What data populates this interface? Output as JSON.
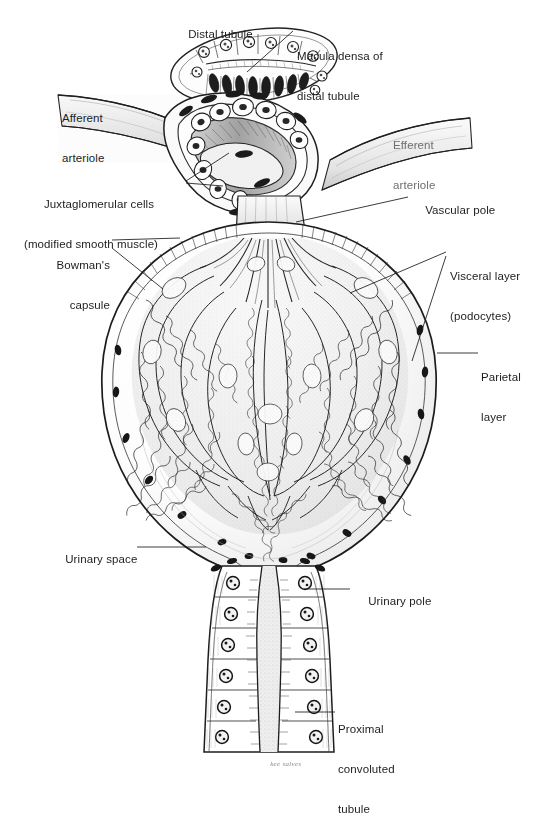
{
  "figure": {
    "medium": "pen-and-ink anatomical illustration",
    "background_color": "#ffffff",
    "ink_color": "#1a1a1a"
  },
  "labels": {
    "distal_tubule": "Distal tubule",
    "macula_densa_l1": "Macula densa of",
    "macula_densa_l2": "distal tubule",
    "afferent_l1": "Afferent",
    "afferent_l2": "arteriole",
    "efferent_l1": "Efferent",
    "efferent_l2": "arteriole",
    "jg_l1": "Juxtaglomerular cells",
    "jg_l2": "(modified smooth muscle)",
    "vascular_pole": "Vascular pole",
    "bowmans_l1": "Bowman's",
    "bowmans_l2": "capsule",
    "visceral_l1": "Visceral layer",
    "visceral_l2": "(podocytes)",
    "parietal_l1": "Parietal",
    "parietal_l2": "layer",
    "urinary_space": "Urinary space",
    "urinary_pole": "Urinary pole",
    "proximal_l1": "Proximal",
    "proximal_l2": "convoluted",
    "proximal_l3": "tubule",
    "signature": "kee salves"
  },
  "structures": [
    {
      "name": "distal-tubule-cross-section",
      "description": "elongated oval tubule in cross section with cuboidal cells and a row of dark macula densa nuclei along its lower wall"
    },
    {
      "name": "afferent-arteriole",
      "description": "vessel entering from upper left, wall cut open to reveal juxtaglomerular cells"
    },
    {
      "name": "efferent-arteriole",
      "description": "vessel leaving toward upper right"
    },
    {
      "name": "juxtaglomerular-cells",
      "description": "plump pale granular cells in the afferent arteriole wall"
    },
    {
      "name": "vascular-pole",
      "description": "point where arterioles enter and leave the corpuscle"
    },
    {
      "name": "bowmans-capsule",
      "description": "large round capsule enclosing the glomerulus"
    },
    {
      "name": "parietal-layer",
      "description": "outer simple squamous epithelial layer of Bowman's capsule"
    },
    {
      "name": "visceral-layer-podocytes",
      "description": "podocyte layer covering the glomerular capillary loops"
    },
    {
      "name": "glomerular-capillary-tuft",
      "description": "branching convoluted capillary loops radiating from the vascular pole"
    },
    {
      "name": "urinary-space",
      "description": "clear space between parietal and visceral layers"
    },
    {
      "name": "urinary-pole",
      "description": "point where the capsule becomes the proximal convoluted tubule"
    },
    {
      "name": "proximal-convoluted-tubule",
      "description": "tubule descending from the urinary pole, cuboidal cells with brush border and round nuclei"
    }
  ],
  "leader_lines": [
    {
      "name": "macula-densa-leader",
      "from": [
        293,
        31
      ],
      "to": [
        247,
        72
      ]
    },
    {
      "name": "jg-leader-a",
      "from": [
        185,
        181
      ],
      "to": [
        228,
        154
      ]
    },
    {
      "name": "jg-leader-b",
      "from": [
        185,
        183
      ],
      "to": [
        222,
        185
      ]
    },
    {
      "name": "vascular-pole-leader",
      "from": [
        408,
        197
      ],
      "to": [
        296,
        222
      ]
    },
    {
      "name": "bowmans-leader-a",
      "from": [
        112,
        240
      ],
      "to": [
        178,
        238
      ]
    },
    {
      "name": "bowmans-leader-b",
      "from": [
        112,
        248
      ],
      "to": [
        162,
        288
      ]
    },
    {
      "name": "visceral-leader-a",
      "from": [
        446,
        252
      ],
      "to": [
        352,
        292
      ]
    },
    {
      "name": "visceral-leader-b",
      "from": [
        446,
        256
      ],
      "to": [
        413,
        360
      ]
    },
    {
      "name": "parietal-leader",
      "from": [
        478,
        353
      ],
      "to": [
        438,
        353
      ]
    },
    {
      "name": "urinary-space-leader",
      "from": [
        137,
        547
      ],
      "to": [
        205,
        547
      ]
    },
    {
      "name": "urinary-pole-leader",
      "from": [
        350,
        589
      ],
      "to": [
        305,
        589
      ]
    },
    {
      "name": "proximal-leader",
      "from": [
        335,
        712
      ],
      "to": [
        296,
        712
      ]
    }
  ]
}
